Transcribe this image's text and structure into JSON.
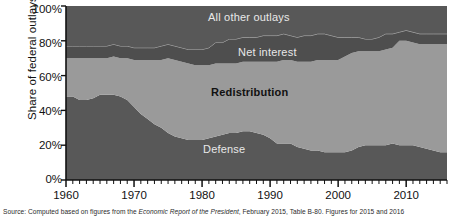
{
  "chart_data": {
    "type": "area",
    "title": "",
    "subtitle": "",
    "xlabel": "",
    "ylabel": "Share of federal outlays",
    "xlim": [
      1960,
      2016
    ],
    "ylim": [
      0,
      100
    ],
    "stacked": true,
    "normalized_percent": true,
    "grid": false,
    "legend_position": "inline-labels",
    "x_tick_labels": [
      "1960",
      "1970",
      "1980",
      "1990",
      "2000",
      "2010"
    ],
    "x_tick_values": [
      1960,
      1970,
      1980,
      1990,
      2000,
      2010
    ],
    "x_minor_tick_interval": 1,
    "y_tick_labels": [
      "0%",
      "20%",
      "40%",
      "60%",
      "80%",
      "100%"
    ],
    "y_tick_values": [
      0,
      20,
      40,
      60,
      80,
      100
    ],
    "x": [
      1960,
      1961,
      1962,
      1963,
      1964,
      1965,
      1966,
      1967,
      1968,
      1969,
      1970,
      1971,
      1972,
      1973,
      1974,
      1975,
      1976,
      1977,
      1978,
      1979,
      1980,
      1981,
      1982,
      1983,
      1984,
      1985,
      1986,
      1987,
      1988,
      1989,
      1990,
      1991,
      1992,
      1993,
      1994,
      1995,
      1996,
      1997,
      1998,
      1999,
      2000,
      2001,
      2002,
      2003,
      2004,
      2005,
      2006,
      2007,
      2008,
      2009,
      2010,
      2011,
      2012,
      2013,
      2014,
      2015,
      2016
    ],
    "series": [
      {
        "name": "Defense",
        "color": "#585858",
        "label_color": "#e8e8e8",
        "values": [
          48,
          48,
          46,
          46,
          47,
          49,
          49,
          49,
          48,
          46,
          42,
          38,
          35,
          32,
          30,
          27,
          25,
          24,
          23,
          23,
          23,
          24,
          25,
          26,
          27,
          27,
          28,
          28,
          27,
          26,
          24,
          21,
          21,
          21,
          19,
          18,
          17,
          17,
          16,
          16,
          16,
          16,
          17,
          19,
          20,
          20,
          20,
          20,
          21,
          20,
          20,
          20,
          19,
          18,
          17,
          16,
          16
        ]
      },
      {
        "name": "Redistribution",
        "color": "#9a9a9a",
        "label_color": "#111111",
        "values": [
          22,
          22,
          24,
          24,
          23,
          21,
          21,
          22,
          22,
          24,
          27,
          31,
          34,
          37,
          39,
          43,
          44,
          44,
          44,
          43,
          43,
          42,
          42,
          41,
          40,
          40,
          40,
          40,
          41,
          42,
          44,
          47,
          48,
          48,
          49,
          50,
          51,
          52,
          53,
          53,
          53,
          55,
          56,
          55,
          54,
          54,
          54,
          55,
          55,
          60,
          60,
          59,
          59,
          60,
          61,
          62,
          62
        ]
      },
      {
        "name": "Net interest",
        "color": "#4e4e4e",
        "label_color": "#e8e8e8",
        "values": [
          7,
          7,
          7,
          7,
          7,
          7,
          7,
          7,
          7,
          7,
          7,
          7,
          7,
          7,
          8,
          8,
          8,
          8,
          8,
          9,
          9,
          10,
          12,
          12,
          14,
          14,
          14,
          14,
          14,
          15,
          15,
          15,
          15,
          14,
          14,
          15,
          15,
          15,
          15,
          14,
          13,
          11,
          9,
          8,
          7,
          7,
          8,
          9,
          8,
          5,
          6,
          6,
          6,
          6,
          6,
          6,
          6
        ]
      },
      {
        "name": "All other outlays",
        "color": "#585858",
        "label_color": "#e8e8e8",
        "values": [
          23,
          23,
          23,
          23,
          23,
          23,
          23,
          22,
          23,
          23,
          24,
          24,
          24,
          24,
          23,
          22,
          23,
          24,
          25,
          25,
          25,
          24,
          21,
          21,
          19,
          19,
          18,
          18,
          18,
          17,
          17,
          17,
          16,
          17,
          18,
          17,
          17,
          16,
          16,
          17,
          18,
          18,
          18,
          18,
          19,
          19,
          18,
          16,
          16,
          15,
          14,
          15,
          16,
          16,
          16,
          16,
          16
        ]
      }
    ],
    "band_labels": [
      {
        "name": "All other outlays",
        "x_px": 232,
        "y_px": 18
      },
      {
        "name": "Net interest",
        "x_px": 277,
        "y_px": 53
      },
      {
        "name": "Redistribution",
        "x_px": 256,
        "y_px": 94
      },
      {
        "name": "Defense",
        "x_px": 230,
        "y_px": 151
      }
    ]
  },
  "axis": {
    "ylabel": "Share of federal outlays",
    "yticks": [
      "100%",
      "80%",
      "60%",
      "40%",
      "20%",
      "0%"
    ],
    "xticks": [
      "1960",
      "1970",
      "1980",
      "1990",
      "2000",
      "2010"
    ]
  },
  "labels": {
    "all_other_outlays": "All other outlays",
    "net_interest": "Net interest",
    "redistribution": "Redistribution",
    "defense": "Defense"
  },
  "source": {
    "prefix": "Source: Computed based on figures from the ",
    "italic": "Economic Report of the President",
    "suffix": ", February 2015, Table B-80. Figures for 2015 and 2016"
  },
  "colors": {
    "dark_band": "#585858",
    "net_interest_band": "#4e4e4e",
    "light_band": "#9a9a9a",
    "axis": "#111111",
    "background": "#ffffff"
  }
}
